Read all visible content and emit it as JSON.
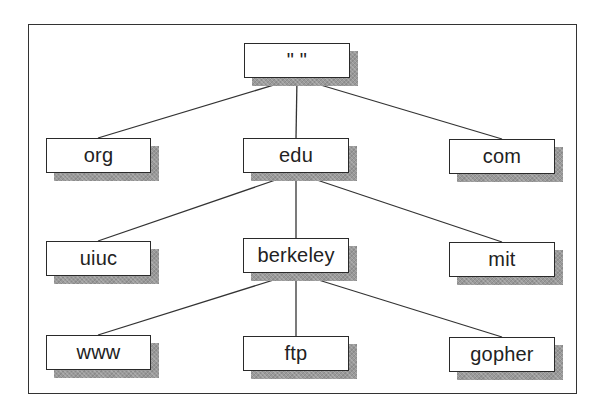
{
  "diagram": {
    "type": "tree",
    "title": "",
    "colors": {
      "border": "#2a2a2a",
      "shadow": "#9a9a9a",
      "background": "#ffffff",
      "line": "#333333"
    },
    "nodes": {
      "root": {
        "label": "\" \"",
        "x": 244,
        "y": 43,
        "w": 106,
        "h": 35
      },
      "org": {
        "label": "org",
        "x": 46,
        "y": 138,
        "w": 105,
        "h": 35
      },
      "edu": {
        "label": "edu",
        "x": 243,
        "y": 138,
        "w": 106,
        "h": 35
      },
      "com": {
        "label": "com",
        "x": 449,
        "y": 139,
        "w": 106,
        "h": 35
      },
      "uiuc": {
        "label": "uiuc",
        "x": 46,
        "y": 241,
        "w": 105,
        "h": 35
      },
      "berkeley": {
        "label": "berkeley",
        "x": 243,
        "y": 238,
        "w": 106,
        "h": 35
      },
      "mit": {
        "label": "mit",
        "x": 449,
        "y": 242,
        "w": 106,
        "h": 35
      },
      "www": {
        "label": "www",
        "x": 46,
        "y": 335,
        "w": 105,
        "h": 35
      },
      "ftp": {
        "label": "ftp",
        "x": 243,
        "y": 336,
        "w": 106,
        "h": 35
      },
      "gopher": {
        "label": "gopher",
        "x": 449,
        "y": 337,
        "w": 106,
        "h": 35
      }
    },
    "edges": [
      [
        "root",
        "org"
      ],
      [
        "root",
        "edu"
      ],
      [
        "root",
        "com"
      ],
      [
        "edu",
        "uiuc"
      ],
      [
        "edu",
        "berkeley"
      ],
      [
        "edu",
        "mit"
      ],
      [
        "berkeley",
        "www"
      ],
      [
        "berkeley",
        "ftp"
      ],
      [
        "berkeley",
        "gopher"
      ]
    ],
    "shadow_offset": {
      "dx": 8,
      "dy": 8
    }
  }
}
